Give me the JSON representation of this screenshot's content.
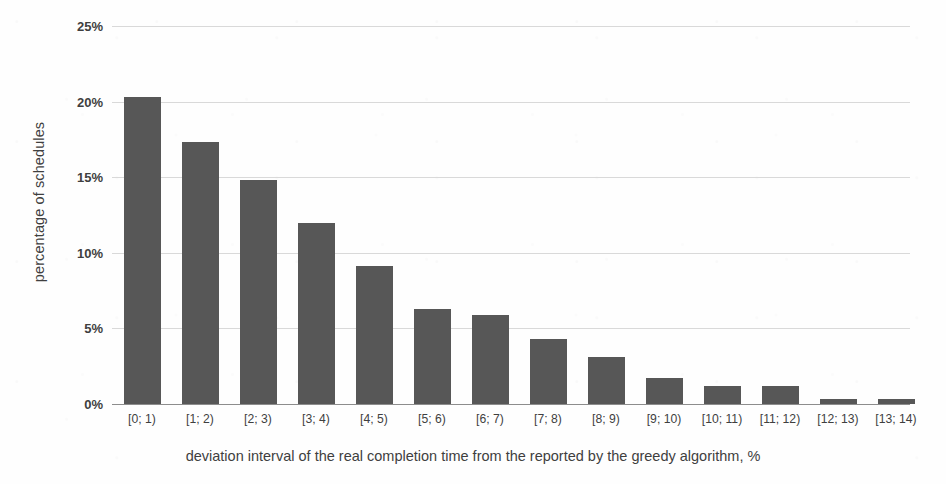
{
  "chart_data": {
    "type": "bar",
    "title": "",
    "xlabel": "deviation interval of the real completion time from the reported by the greedy algorithm, %",
    "ylabel": "percentage of schedules",
    "categories": [
      "[0; 1)",
      "[1; 2)",
      "[2; 3)",
      "[3; 4)",
      "[4; 5)",
      "[5; 6)",
      "[6; 7)",
      "[7; 8)",
      "[8; 9)",
      "[9; 10)",
      "[10; 11)",
      "[11; 12)",
      "[12; 13)",
      "[13; 14)"
    ],
    "values": [
      20.3,
      17.3,
      14.8,
      12.0,
      9.1,
      6.3,
      5.9,
      4.3,
      3.1,
      1.7,
      1.2,
      1.2,
      0.3,
      0.3
    ],
    "ylim": [
      0,
      25
    ],
    "ytick_labels": [
      "0%",
      "5%",
      "10%",
      "15%",
      "20%",
      "25%"
    ],
    "ytick_values": [
      0,
      5,
      10,
      15,
      20,
      25
    ],
    "grid": true,
    "legend": false,
    "bar_color": "#575757",
    "grid_color": "#d9d9d9",
    "axis_color": "#8d8d8d",
    "background_color": "#fefefe"
  }
}
